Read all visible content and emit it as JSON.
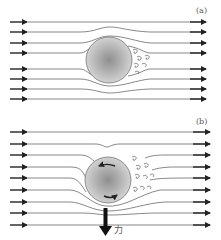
{
  "panels": [
    {
      "id": "a",
      "label": "(a)",
      "description": "Flow around a non-rotating sphere: symmetric streamlines with turbulent wake behind"
    },
    {
      "id": "b",
      "label": "(b)",
      "description": "Flow around a rotating sphere: streamlines deflected, wake shifted upward, resulting downward force"
    }
  ],
  "force_label": "力",
  "colors": {
    "stroke": "#333333",
    "line": "#555555",
    "ball_center": "#9a9a9a",
    "ball_edge": "#d0d0d0"
  }
}
